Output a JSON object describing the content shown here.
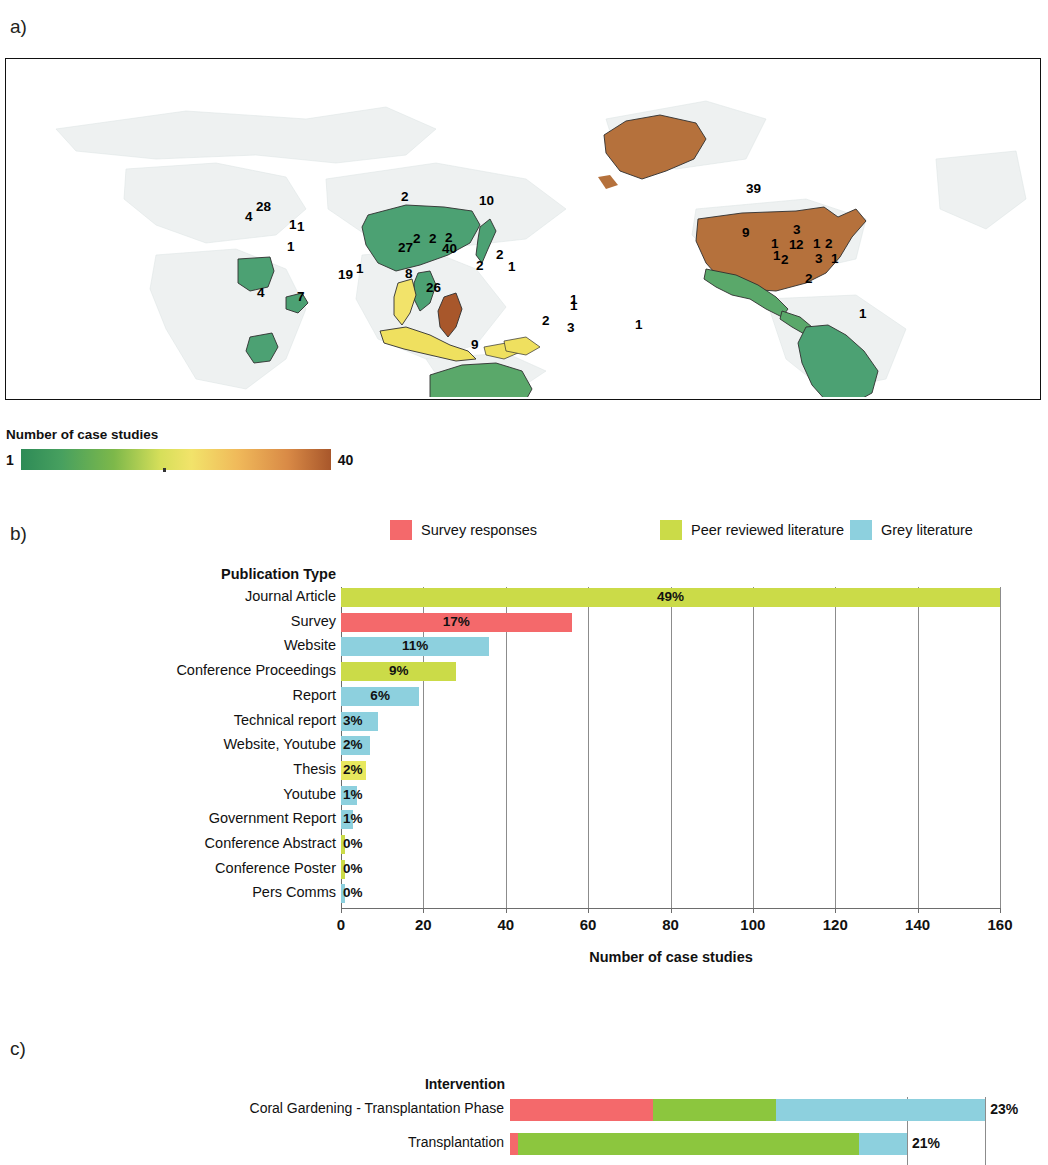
{
  "panels": {
    "a_label": "a)",
    "b_label": "b)",
    "c_label": "c)"
  },
  "colorbar": {
    "title": "Number of case studies",
    "min": "1",
    "max": "40",
    "low_color": "#2e8b57",
    "mid_color": "#f2e36a",
    "high_color": "#a8572b"
  },
  "legend": {
    "items": [
      {
        "label": "Survey responses",
        "color": "#F4696B"
      },
      {
        "label": "Peer reviewed literature",
        "color": "#CBDB48"
      },
      {
        "label": "Grey literature",
        "color": "#8DD0DE"
      }
    ]
  },
  "map": {
    "labels": [
      {
        "value": "4",
        "x": 244,
        "y": 216
      },
      {
        "value": "28",
        "x": 255,
        "y": 206
      },
      {
        "value": "1",
        "x": 288,
        "y": 224
      },
      {
        "value": "1",
        "x": 296,
        "y": 226
      },
      {
        "value": "1",
        "x": 286,
        "y": 246
      },
      {
        "value": "4",
        "x": 256,
        "y": 292
      },
      {
        "value": "7",
        "x": 296,
        "y": 296
      },
      {
        "value": "19",
        "x": 337,
        "y": 274
      },
      {
        "value": "1",
        "x": 355,
        "y": 268
      },
      {
        "value": "2",
        "x": 400,
        "y": 196
      },
      {
        "value": "10",
        "x": 478,
        "y": 200
      },
      {
        "value": "27",
        "x": 397,
        "y": 247
      },
      {
        "value": "2",
        "x": 412,
        "y": 238
      },
      {
        "value": "2",
        "x": 428,
        "y": 238
      },
      {
        "value": "2",
        "x": 444,
        "y": 237
      },
      {
        "value": "40",
        "x": 441,
        "y": 248
      },
      {
        "value": "8",
        "x": 404,
        "y": 273
      },
      {
        "value": "26",
        "x": 425,
        "y": 287
      },
      {
        "value": "2",
        "x": 475,
        "y": 265
      },
      {
        "value": "1",
        "x": 507,
        "y": 266
      },
      {
        "value": "2",
        "x": 495,
        "y": 254
      },
      {
        "value": "9",
        "x": 470,
        "y": 344
      },
      {
        "value": "2",
        "x": 541,
        "y": 320
      },
      {
        "value": "3",
        "x": 566,
        "y": 327
      },
      {
        "value": "1",
        "x": 569,
        "y": 299
      },
      {
        "value": "1",
        "x": 569,
        "y": 305
      },
      {
        "value": "1",
        "x": 634,
        "y": 324
      },
      {
        "value": "39",
        "x": 745,
        "y": 188
      },
      {
        "value": "9",
        "x": 741,
        "y": 232
      },
      {
        "value": "3",
        "x": 792,
        "y": 229
      },
      {
        "value": "1",
        "x": 770,
        "y": 243
      },
      {
        "value": "1",
        "x": 788,
        "y": 244
      },
      {
        "value": "2",
        "x": 795,
        "y": 244
      },
      {
        "value": "1",
        "x": 812,
        "y": 243
      },
      {
        "value": "2",
        "x": 824,
        "y": 243
      },
      {
        "value": "1",
        "x": 772,
        "y": 255
      },
      {
        "value": "2",
        "x": 780,
        "y": 259
      },
      {
        "value": "3",
        "x": 814,
        "y": 258
      },
      {
        "value": "1",
        "x": 830,
        "y": 258
      },
      {
        "value": "2",
        "x": 804,
        "y": 278
      },
      {
        "value": "1",
        "x": 858,
        "y": 313
      }
    ],
    "regions": [
      {
        "name": "usa",
        "color": "#b5713c"
      },
      {
        "name": "alaska",
        "color": "#b5713c"
      },
      {
        "name": "philippines",
        "color": "#a8572b"
      },
      {
        "name": "thailand",
        "color": "#f2e36a"
      },
      {
        "name": "indonesia",
        "color": "#efe05f"
      },
      {
        "name": "mexico",
        "color": "#5aa86a"
      },
      {
        "name": "brazil",
        "color": "#4ca173"
      },
      {
        "name": "australia",
        "color": "#5aa86a"
      },
      {
        "name": "china",
        "color": "#4ca173"
      },
      {
        "name": "egypt",
        "color": "#4ca173"
      },
      {
        "name": "tanzania",
        "color": "#4ca173"
      }
    ]
  },
  "chart_data": [
    {
      "type": "bar",
      "panel": "b",
      "orientation": "horizontal",
      "title": "Publication Type",
      "xlabel": "Number of case studies",
      "ylabel": "",
      "xlim": [
        0,
        160
      ],
      "xticks": [
        0,
        20,
        40,
        60,
        80,
        100,
        120,
        140,
        160
      ],
      "grid": true,
      "legend_position": "top",
      "categories": [
        "Journal Article",
        "Survey",
        "Website",
        "Conference Proceedings",
        "Report",
        "Technical report",
        "Website, Youtube",
        "Thesis",
        "Youtube",
        "Government Report",
        "Conference Abstract",
        "Conference Poster",
        "Pers Comms"
      ],
      "values": [
        160,
        56,
        36,
        28,
        19,
        9,
        7,
        6,
        4,
        3,
        1,
        1,
        1
      ],
      "data_labels": [
        "49%",
        "17%",
        "11%",
        "9%",
        "6%",
        "3%",
        "2%",
        "2%",
        "1%",
        "1%",
        "0%",
        "0%",
        "0%"
      ],
      "series_of_bar": [
        "Peer reviewed literature",
        "Survey responses",
        "Grey literature",
        "Peer reviewed literature",
        "Grey literature",
        "Grey literature",
        "Grey literature",
        "Peer reviewed literature",
        "Grey literature",
        "Grey literature",
        "Peer reviewed literature",
        "Peer reviewed literature",
        "Grey literature"
      ],
      "bar_colors": [
        "#CBDB48",
        "#F4696B",
        "#8DD0DE",
        "#CBDB48",
        "#8DD0DE",
        "#8DD0DE",
        "#8DD0DE",
        "#E8E85E",
        "#8DD0DE",
        "#8DD0DE",
        "#CBDB48",
        "#CBDB48",
        "#8DD0DE"
      ]
    },
    {
      "type": "bar",
      "panel": "c",
      "orientation": "horizontal",
      "stacked": true,
      "title": "Intervention",
      "xlabel": "",
      "categories": [
        "Coral Gardening - Transplantation Phase",
        "Transplantation"
      ],
      "data_labels": [
        "23%",
        "21%"
      ],
      "series": [
        {
          "name": "Survey responses",
          "color": "#F4696B",
          "values": [
            30,
            2
          ]
        },
        {
          "name": "Peer reviewed literature",
          "color": "#8CC63E",
          "values": [
            26,
            86
          ]
        },
        {
          "name": "Grey literature",
          "color": "#8DD0DE",
          "values": [
            44,
            12
          ]
        }
      ],
      "row_totals": [
        100,
        100
      ],
      "row_widths_pct": [
        97,
        81
      ],
      "gridlines_pct": [
        81,
        97
      ]
    }
  ]
}
